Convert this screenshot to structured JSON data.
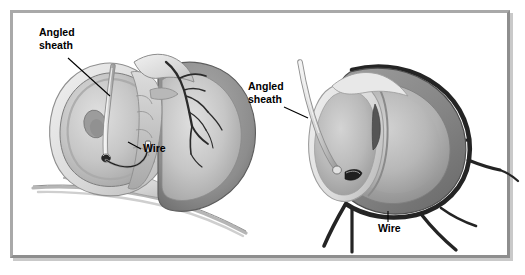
{
  "figure": {
    "background_color": "#ffffff",
    "frame_color": "#a9a9a9",
    "frame_shadow_color": "#c9c9c9"
  },
  "panels": [
    {
      "id": "left-panel",
      "name": "frontal-heart-view",
      "labels": [
        {
          "id": "left-angled-sheath",
          "name": "angled-sheath-label",
          "line1": "Angled",
          "line2": "sheath",
          "x": 39,
          "y": 36
        },
        {
          "id": "left-wire",
          "name": "wire-label",
          "text": "Wire",
          "x": 143,
          "y": 152
        }
      ]
    },
    {
      "id": "right-panel",
      "name": "short-axis-heart-view",
      "labels": [
        {
          "id": "right-angled-sheath",
          "name": "angled-sheath-label",
          "line1": "Angled",
          "line2": "sheath",
          "x": 248,
          "y": 90
        },
        {
          "id": "right-wire",
          "name": "wire-label",
          "text": "Wire",
          "x": 378,
          "y": 232
        }
      ]
    }
  ],
  "palette": {
    "myocardium_dark": "#7b7b7b",
    "myocardium_mid": "#9a9a9a",
    "chamber_light": "#cfcfcf",
    "chamber_mid": "#b5b5b5",
    "epicardium_pale": "#e3e3e3",
    "vessel_dark": "#2f2f2f",
    "sheath_light": "#d9d9d9",
    "outline": "#4a4a4a",
    "label_text": "#000000"
  }
}
